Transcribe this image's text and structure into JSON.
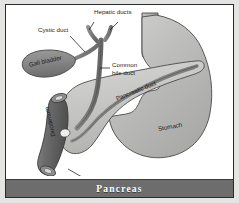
{
  "figure": {
    "title": "Pancreas",
    "caption_banner_color": "#6d6d6d",
    "background_color": "#ffffff",
    "border_color": "#2b2b2b"
  },
  "labels": {
    "hepatic_ducts": "Hepatic ducts",
    "cystic_duct": "Cystic duct",
    "gall_bladder": "Gall bladder",
    "common_bile_duct_line1": "Common",
    "common_bile_duct_line2": "bile duct",
    "pancreatic_duct": "Pancreatic duct",
    "stomach": "Stomach",
    "duodenum": "Duodenum",
    "ampulla_of_vater": "Ampulla of Vater"
  },
  "anatomy": {
    "structures": [
      {
        "name": "hepatic-ducts",
        "fill": "#7e7e7e",
        "description": "Y-shaped paired ducts at top"
      },
      {
        "name": "cystic-duct",
        "fill": "#7e7e7e",
        "description": "duct from gall bladder to common bile duct"
      },
      {
        "name": "gall-bladder",
        "fill": "#8a8a8a",
        "description": "teardrop sac at upper left"
      },
      {
        "name": "common-bile-duct",
        "fill": "#7e7e7e",
        "description": "vertical duct descending to duodenum"
      },
      {
        "name": "pancreas",
        "fill": "#c9c9c7",
        "description": "elongated gland across center"
      },
      {
        "name": "pancreatic-duct",
        "fill": "#8d8d8d",
        "description": "duct within pancreas"
      },
      {
        "name": "stomach",
        "fill": "#b9b9b7",
        "description": "large organ at right with esophagus"
      },
      {
        "name": "esophagus",
        "fill": "#b0b0ae",
        "description": "vertical tube at top right"
      },
      {
        "name": "duodenum",
        "fill": "#6f6f6f",
        "description": "dark curved tube at left"
      },
      {
        "name": "ampulla-of-vater",
        "fill": "#e8e8e6",
        "description": "opening where ducts meet duodenum"
      }
    ]
  },
  "colors": {
    "outline": "#3a3a3a",
    "light_tissue": "#c9c9c7",
    "mid_tissue": "#b9b9b7",
    "dark_tissue": "#7e7e7e",
    "darkest_tissue": "#6f6f6f",
    "label_text": "#1a1a1a",
    "banner_text": "#ffffff"
  }
}
